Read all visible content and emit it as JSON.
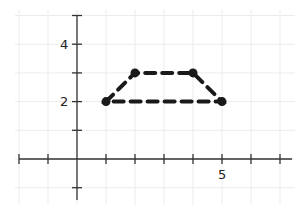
{
  "chart_data": {
    "type": "line",
    "title": "",
    "xlabel": "",
    "ylabel": "",
    "xlim": [
      -2,
      7
    ],
    "ylim": [
      -1,
      5
    ],
    "grid": true,
    "x_tick_labels": [
      {
        "value": 5,
        "label": "5"
      }
    ],
    "y_tick_labels": [
      {
        "value": 2,
        "label": "2"
      },
      {
        "value": 4,
        "label": "4"
      }
    ],
    "series": [
      {
        "name": "trapezoid",
        "style": "dashed",
        "closed": true,
        "color": "#1a1a1a",
        "points": [
          {
            "x": 1,
            "y": 2
          },
          {
            "x": 2,
            "y": 3
          },
          {
            "x": 4,
            "y": 3
          },
          {
            "x": 5,
            "y": 2
          }
        ]
      }
    ]
  },
  "labels": {
    "x5": "5",
    "y2": "2",
    "y4": "4"
  }
}
